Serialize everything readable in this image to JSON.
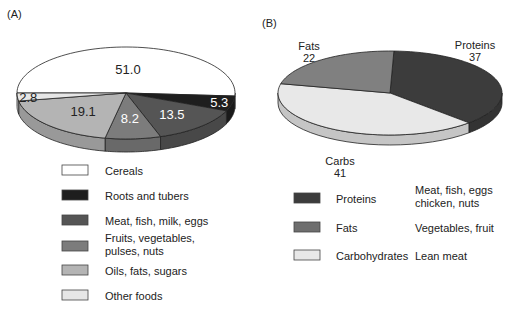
{
  "chart_data": [
    {
      "type": "pie",
      "panel_label": "(A)",
      "style": "3d",
      "title": "",
      "slices": [
        {
          "name": "Cereals",
          "value": 51.0,
          "label": "51.0",
          "color": "#ffffff",
          "label_color": "#222222"
        },
        {
          "name": "Roots and tubers",
          "value": 5.3,
          "label": "5.3",
          "color": "#1e1e1e",
          "label_color": "#ffffff"
        },
        {
          "name": "Meat, fish, milk, eggs",
          "value": 13.5,
          "label": "13.5",
          "color": "#555555",
          "label_color": "#ffffff"
        },
        {
          "name": "Fruits, vegetables, pulses, nuts",
          "value": 8.2,
          "label": "8.2",
          "color": "#7c7c7c",
          "label_color": "#ffffff"
        },
        {
          "name": "Oils, fats, sugars",
          "value": 19.1,
          "label": "19.1",
          "color": "#b4b4b4",
          "label_color": "#222222"
        },
        {
          "name": "Other foods",
          "value": 2.8,
          "label": "2.8",
          "color": "#e6e6e6",
          "label_color": "#222222"
        }
      ],
      "legend": {
        "placement": "bottom",
        "entries": [
          {
            "label": "Cereals",
            "color": "#ffffff"
          },
          {
            "label": "Roots and tubers",
            "color": "#1e1e1e"
          },
          {
            "label": "Meat, fish, milk, eggs",
            "color": "#555555"
          },
          {
            "label": "Fruits, vegetables,\npulses, nuts",
            "lines": [
              "Fruits, vegetables,",
              "pulses, nuts"
            ],
            "color": "#7c7c7c"
          },
          {
            "label": "Oils, fats, sugars",
            "color": "#b4b4b4"
          },
          {
            "label": "Other foods",
            "color": "#e6e6e6"
          }
        ]
      }
    },
    {
      "type": "pie",
      "panel_label": "(B)",
      "style": "3d",
      "title": "",
      "slices": [
        {
          "name": "Proteins",
          "value": 37,
          "label_lines": [
            "Proteins",
            "37"
          ],
          "color": "#3c3c3c"
        },
        {
          "name": "Carbs",
          "value": 41,
          "label_lines": [
            "Carbs",
            "41"
          ],
          "color": "#e8e8e8"
        },
        {
          "name": "Fats",
          "value": 22,
          "label_lines": [
            "Fats",
            "22"
          ],
          "color": "#808080"
        }
      ],
      "legend": {
        "placement": "bottom",
        "entries": [
          {
            "label": "Proteins",
            "color": "#3c3c3c",
            "description_lines": [
              "Meat, fish, eggs",
              "chicken, nuts"
            ]
          },
          {
            "label": "Fats",
            "color": "#6e6e6e",
            "description_lines": [
              "Vegetables, fruit"
            ]
          },
          {
            "label": "Carbohydrates",
            "color": "#e8e8e8",
            "description_lines": [
              "Lean meat"
            ]
          }
        ]
      }
    }
  ]
}
